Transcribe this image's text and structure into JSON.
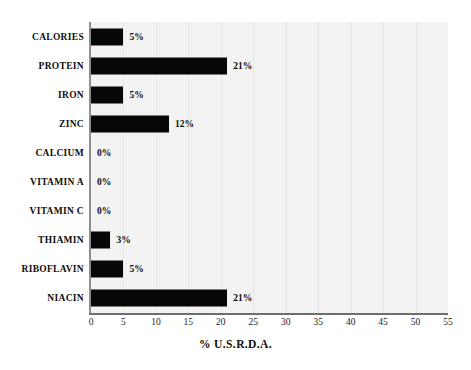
{
  "chart_data": {
    "type": "bar",
    "orientation": "horizontal",
    "title": "",
    "xlabel": "% U.S.R.D.A.",
    "ylabel": "",
    "xlim": [
      0,
      55
    ],
    "xticks": [
      0,
      5,
      10,
      15,
      20,
      25,
      30,
      35,
      40,
      45,
      50,
      55
    ],
    "xtick_labels": [
      "0",
      "5",
      "10",
      "15",
      "20",
      "25",
      "30",
      "35",
      "40",
      "45",
      "50",
      "55"
    ],
    "grid": "vertical-only",
    "legend": "none",
    "categories": [
      "CALORIES",
      "PROTEIN",
      "IRON",
      "ZINC",
      "CALCIUM",
      "VITAMIN A",
      "VITAMIN C",
      "THIAMIN",
      "RIBOFLAVIN",
      "NIACIN"
    ],
    "values": [
      5,
      21,
      5,
      12,
      0,
      0,
      0,
      3,
      5,
      21
    ],
    "value_labels": [
      "5%",
      "21%",
      "5%",
      "12%",
      "0%",
      "0%",
      "0%",
      "3%",
      "5%",
      "21%"
    ],
    "bar_color": "#070707",
    "plot_background": "#f3f3f3",
    "gridline_color": "#e6e6e6",
    "axis_color": "#6e6e6e"
  }
}
